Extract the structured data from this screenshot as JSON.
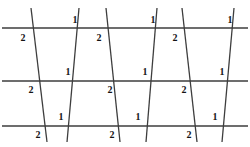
{
  "figure": {
    "title": "Parallel lines cut by transversals with numbered angles",
    "width": 250,
    "height": 147,
    "background_color": "#ffffff",
    "line_color": "#3d3d3d",
    "label_color": "#141414"
  },
  "parallel_lines": [
    {
      "name": "top-parallel-line",
      "y": 28,
      "x1": 2,
      "x2": 248,
      "stroke_width": 1.5
    },
    {
      "name": "middle-parallel-line",
      "y": 81,
      "x1": 2,
      "x2": 248,
      "stroke_width": 1.5
    },
    {
      "name": "bottom-parallel-line",
      "y": 126,
      "x1": 2,
      "x2": 248,
      "stroke_width": 1.5
    }
  ],
  "transversals": [
    {
      "name": "transversal-1",
      "x_top": 31,
      "y_top": 8,
      "x_bottom": 47,
      "y_bottom": 142,
      "stroke_width": 1.3
    },
    {
      "name": "transversal-2",
      "x_top": 79,
      "y_top": 8,
      "x_bottom": 67,
      "y_bottom": 142,
      "stroke_width": 1.3
    },
    {
      "name": "transversal-3",
      "x_top": 106,
      "y_top": 8,
      "x_bottom": 120,
      "y_bottom": 142,
      "stroke_width": 1.3
    },
    {
      "name": "transversal-4",
      "x_top": 157,
      "y_top": 8,
      "x_bottom": 146,
      "y_bottom": 142,
      "stroke_width": 1.3
    },
    {
      "name": "transversal-5",
      "x_top": 182,
      "y_top": 8,
      "x_bottom": 197,
      "y_bottom": 142,
      "stroke_width": 1.3
    },
    {
      "name": "transversal-6",
      "x_top": 234,
      "y_top": 8,
      "x_bottom": 222,
      "y_bottom": 142,
      "stroke_width": 1.3
    }
  ],
  "angle_labels": [
    {
      "id": "label-r1-c1",
      "text": "2",
      "x": 23,
      "y": 38,
      "row": "top",
      "position": "below-left"
    },
    {
      "id": "label-r1-c2",
      "text": "1",
      "x": 75,
      "y": 20,
      "row": "top",
      "position": "above-left"
    },
    {
      "id": "label-r1-c3",
      "text": "2",
      "x": 99,
      "y": 38,
      "row": "top",
      "position": "below-left"
    },
    {
      "id": "label-r1-c4",
      "text": "1",
      "x": 153,
      "y": 20,
      "row": "top",
      "position": "above-left"
    },
    {
      "id": "label-r1-c5",
      "text": "2",
      "x": 175,
      "y": 38,
      "row": "top",
      "position": "below-left"
    },
    {
      "id": "label-r1-c6",
      "text": "1",
      "x": 230,
      "y": 20,
      "row": "top",
      "position": "above-left"
    },
    {
      "id": "label-r2-c1",
      "text": "2",
      "x": 31,
      "y": 90,
      "row": "middle",
      "position": "below-left"
    },
    {
      "id": "label-r2-c2",
      "text": "1",
      "x": 68,
      "y": 72,
      "row": "middle",
      "position": "above-left"
    },
    {
      "id": "label-r2-c3",
      "text": "2",
      "x": 110,
      "y": 90,
      "row": "middle",
      "position": "below-left"
    },
    {
      "id": "label-r2-c4",
      "text": "1",
      "x": 145,
      "y": 72,
      "row": "middle",
      "position": "above-left"
    },
    {
      "id": "label-r2-c5",
      "text": "2",
      "x": 184,
      "y": 90,
      "row": "middle",
      "position": "below-left"
    },
    {
      "id": "label-r2-c6",
      "text": "1",
      "x": 222,
      "y": 72,
      "row": "middle",
      "position": "above-left"
    },
    {
      "id": "label-r3-c1",
      "text": "2",
      "x": 38,
      "y": 135,
      "row": "bottom",
      "position": "below-left"
    },
    {
      "id": "label-r3-c2",
      "text": "1",
      "x": 61,
      "y": 117,
      "row": "bottom",
      "position": "above-left"
    },
    {
      "id": "label-r3-c3",
      "text": "2",
      "x": 112,
      "y": 135,
      "row": "bottom",
      "position": "below-left"
    },
    {
      "id": "label-r3-c4",
      "text": "1",
      "x": 138,
      "y": 117,
      "row": "bottom",
      "position": "above-left"
    },
    {
      "id": "label-r3-c5",
      "text": "2",
      "x": 189,
      "y": 135,
      "row": "bottom",
      "position": "below-left"
    },
    {
      "id": "label-r3-c6",
      "text": "1",
      "x": 215,
      "y": 117,
      "row": "bottom",
      "position": "above-left"
    }
  ]
}
